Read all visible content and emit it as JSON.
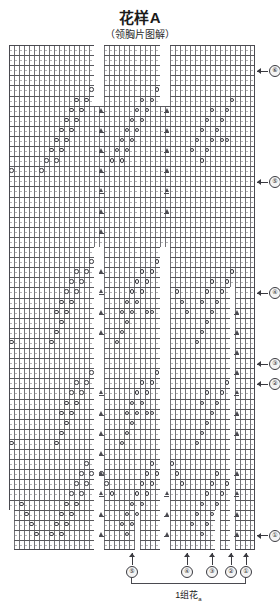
{
  "header": {
    "title": "花样A",
    "subtitle": "（领胸片图解）"
  },
  "chart_data": {
    "type": "table",
    "title": "花样A",
    "subtitle": "（领胸片图解）",
    "grid": {
      "columns": 49,
      "rows": 50,
      "cell_width_px": 5,
      "cell_height_px": 10
    },
    "symbols": [
      {
        "key": "yo",
        "name": "yarn-over-circle",
        "glyph": "○"
      },
      {
        "key": "dec",
        "name": "decrease-triangle",
        "glyph": "▲"
      }
    ],
    "row_markers": [
      {
        "label": "⑥",
        "row": 2
      },
      {
        "label": "⑤",
        "row": 13
      },
      {
        "label": "④",
        "row": 24
      },
      {
        "label": "③",
        "row": 31
      },
      {
        "label": "②",
        "row": 33
      },
      {
        "label": "①",
        "row": 48
      }
    ],
    "column_markers": [
      {
        "label": "⑤"
      },
      {
        "label": "④"
      },
      {
        "label": "③"
      },
      {
        "label": "②"
      },
      {
        "label": "①"
      }
    ],
    "repeat_label": "1组花",
    "repeat_label_sub": "a",
    "colors": {
      "grid_line": "#5a5a5f",
      "grid_row_line": "#46464b",
      "symbol_stroke": "#3a3a40",
      "background": "#ffffff"
    }
  }
}
